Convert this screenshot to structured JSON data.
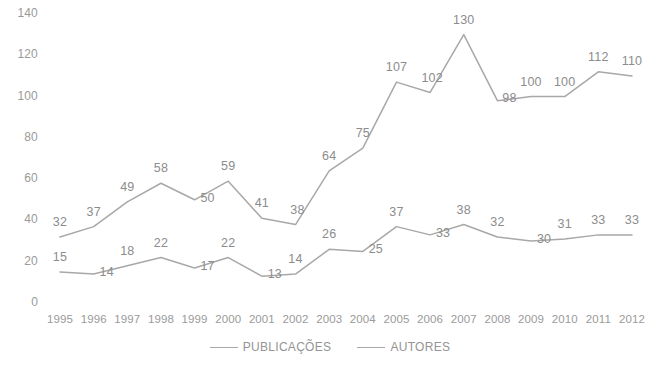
{
  "chart_data": {
    "type": "line",
    "title": "",
    "xlabel": "",
    "ylabel": "",
    "categories": [
      "1995",
      "1996",
      "1997",
      "1998",
      "1999",
      "2000",
      "2001",
      "2002",
      "2003",
      "2004",
      "2005",
      "2006",
      "2007",
      "2008",
      "2009",
      "2010",
      "2011",
      "2012"
    ],
    "series": [
      {
        "name": "PUBLICAÇÕES",
        "color": "#a8a8a8",
        "values": [
          32,
          37,
          49,
          58,
          50,
          59,
          41,
          38,
          64,
          75,
          107,
          102,
          130,
          98,
          100,
          100,
          112,
          110
        ]
      },
      {
        "name": "AUTORES",
        "color": "#a8a8a8",
        "values": [
          15,
          14,
          18,
          22,
          17,
          22,
          13,
          14,
          26,
          25,
          37,
          33,
          38,
          32,
          30,
          31,
          33,
          33
        ]
      }
    ],
    "ylim": [
      0,
      140
    ],
    "ytick_values": [
      0,
      20,
      40,
      60,
      80,
      100,
      120,
      140
    ],
    "ytick_labels": [
      "0",
      "20",
      "40",
      "60",
      "80",
      "100",
      "120",
      "140"
    ],
    "grid": false,
    "data_labels": true,
    "legend_position": "bottom"
  },
  "legend": {
    "entries": [
      {
        "label": "PUBLICAÇÕES"
      },
      {
        "label": "AUTORES"
      }
    ]
  },
  "colors": {
    "line": "#a8a8a8",
    "text": "#9a9a9a",
    "label": "#8c8c8c",
    "background": "#ffffff"
  }
}
